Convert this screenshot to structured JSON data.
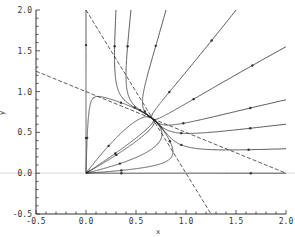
{
  "chart_data": {
    "type": "line",
    "title": "",
    "xlabel": "x",
    "ylabel": "y",
    "xlim": [
      -0.5,
      2.0
    ],
    "ylim": [
      -0.5,
      2.0
    ],
    "xticks": [
      "-0.5",
      "0.0",
      "0.5",
      "1.0",
      "1.5",
      "2.0"
    ],
    "yticks": [
      "-0.5",
      "0.0",
      "0.5",
      "1.0",
      "1.5",
      "2.0"
    ],
    "grid": false,
    "legend": null,
    "system": {
      "description": "Competing species phase portrait",
      "dx": "x*(2 - 2x - y)",
      "dy": "y*(2 - x - 2y)",
      "equilibrium": [
        0.6667,
        0.6667
      ]
    },
    "nullclines": [
      {
        "name": "x-nullcline",
        "style": "dashed",
        "points": [
          [
            0.0,
            2.0
          ],
          [
            1.25,
            -0.5
          ]
        ]
      },
      {
        "name": "y-nullcline",
        "style": "dashed",
        "points": [
          [
            -0.5,
            1.25
          ],
          [
            2.0,
            0.0
          ]
        ]
      }
    ],
    "trajectories": [
      {
        "start": [
          0.0,
          2.0
        ]
      },
      {
        "start": [
          0.3,
          2.0
        ]
      },
      {
        "start": [
          0.45,
          2.0
        ]
      },
      {
        "start": [
          0.8,
          2.0
        ]
      },
      {
        "start": [
          1.5,
          2.0
        ]
      },
      {
        "start": [
          2.0,
          1.55
        ]
      },
      {
        "start": [
          2.0,
          0.9
        ]
      },
      {
        "start": [
          2.0,
          0.6
        ]
      },
      {
        "start": [
          2.0,
          0.3
        ]
      },
      {
        "start": [
          2.0,
          0.0
        ]
      },
      {
        "start": [
          0.0,
          0.0005
        ]
      },
      {
        "start": [
          0.0005,
          0.00035
        ]
      },
      {
        "start": [
          0.0005,
          0.0008
        ]
      },
      {
        "start": [
          0.0005,
          0.0004
        ]
      },
      {
        "start": [
          0.0005,
          0.00015
        ]
      },
      {
        "start": [
          0.0005,
          4e-05
        ]
      },
      {
        "start": [
          0.0005,
          0.0
        ]
      },
      {
        "start": [
          1e-05,
          0.0005
        ]
      }
    ],
    "colors": {
      "line": "#333333",
      "zero_line": "#d0d0d0",
      "axis": "#333333"
    }
  }
}
